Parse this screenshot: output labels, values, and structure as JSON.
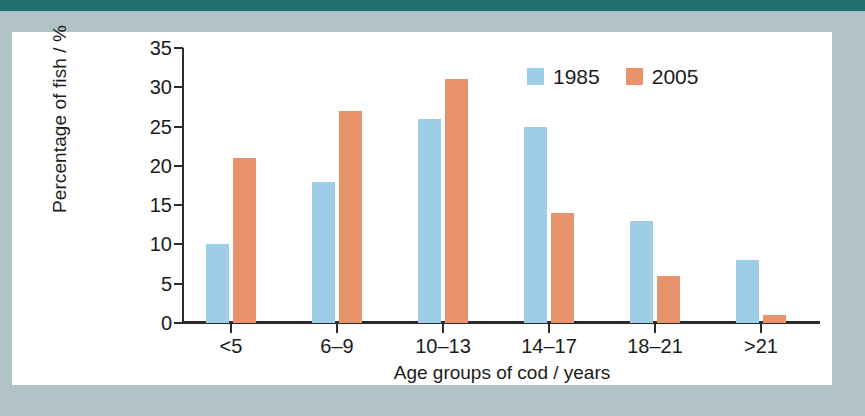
{
  "decor": {
    "top_band_color": "#1f6f71",
    "surround_color": "#b2c3c7",
    "card_color": "#ffffff"
  },
  "chart_data": {
    "type": "bar",
    "title": "",
    "xlabel": "Age groups of cod / years",
    "ylabel": "Percentage of fish / %",
    "categories": [
      "<5",
      "6–9",
      "10–13",
      "14–17",
      "18–21",
      ">21"
    ],
    "series": [
      {
        "name": "1985",
        "color": "#9ecde8",
        "values": [
          10,
          18,
          26,
          25,
          13,
          8
        ]
      },
      {
        "name": "2005",
        "color": "#e8936b",
        "values": [
          21,
          27,
          31,
          14,
          6,
          1
        ]
      }
    ],
    "ylim": [
      0,
      35
    ],
    "yticks": [
      0,
      5,
      10,
      15,
      20,
      25,
      30,
      35
    ],
    "ytick_labels": [
      "0",
      "5",
      "10",
      "15",
      "20",
      "25",
      "30",
      "35"
    ],
    "grid": false,
    "legend_position": "top-right",
    "legend_entries": [
      "1985",
      "2005"
    ]
  }
}
